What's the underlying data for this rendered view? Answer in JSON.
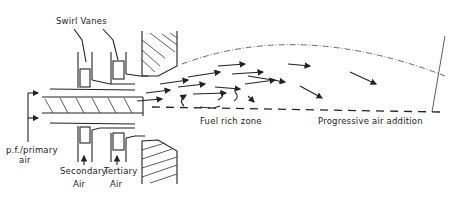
{
  "diagram": {
    "type": "burner-schematic",
    "labels": {
      "swirl_vanes": "Swirl Vanes",
      "pf_primary_air_line1": "p.f./primary",
      "pf_primary_air_line2": "air",
      "secondary_air_line1": "Secondary",
      "secondary_air_line2": "Air",
      "tertiary_air_line1": "Tertiary",
      "tertiary_air_line2": "Air",
      "fuel_rich_zone": "Fuel rich zone",
      "progressive_air_addition": "Progressive air addition"
    },
    "colors": {
      "line": "#222222",
      "background": "#ffffff"
    }
  }
}
